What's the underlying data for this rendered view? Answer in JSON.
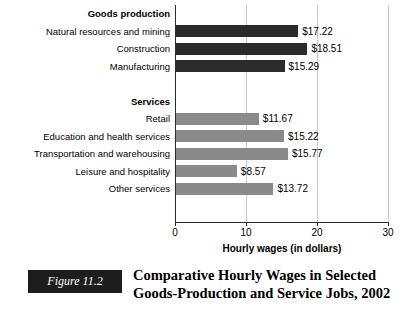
{
  "chart_data": {
    "type": "bar",
    "orientation": "horizontal",
    "title": "Comparative Hourly Wages in Selected Goods-Production and Service Jobs, 2002",
    "xlabel": "Hourly wages (in dollars)",
    "ylabel": "",
    "xlim": [
      0,
      30
    ],
    "xticks": [
      "0",
      "10",
      "20",
      "30"
    ],
    "grid": true,
    "legend": "none",
    "groups": [
      {
        "name": "Goods production",
        "color": "#2b2b2b",
        "categories": [
          "Natural resources and mining",
          "Construction",
          "Manufacturing"
        ],
        "values": [
          17.22,
          18.51,
          15.29
        ],
        "labels": [
          "$17.22",
          "$18.51",
          "$15.29"
        ]
      },
      {
        "name": "Services",
        "color": "#8a8a8a",
        "categories": [
          "Retail",
          "Education and health services",
          "Transportation and warehousing",
          "Leisure and hospitality",
          "Other services"
        ],
        "values": [
          11.67,
          15.22,
          15.77,
          8.57,
          13.72
        ],
        "labels": [
          "$11.67",
          "$15.22",
          "$15.77",
          "$8.57",
          "$13.72"
        ]
      }
    ]
  },
  "rows": [
    {
      "kind": "header",
      "label": "Goods production"
    },
    {
      "kind": "bar",
      "label": "Natural resources and mining",
      "value": 17.22,
      "value_label": "$17.22",
      "series": "goods"
    },
    {
      "kind": "bar",
      "label": "Construction",
      "value": 18.51,
      "value_label": "$18.51",
      "series": "goods"
    },
    {
      "kind": "bar",
      "label": "Manufacturing",
      "value": 15.29,
      "value_label": "$15.29",
      "series": "goods"
    },
    {
      "kind": "spacer",
      "label": ""
    },
    {
      "kind": "header",
      "label": "Services"
    },
    {
      "kind": "bar",
      "label": "Retail",
      "value": 11.67,
      "value_label": "$11.67",
      "series": "services"
    },
    {
      "kind": "bar",
      "label": "Education and health services",
      "value": 15.22,
      "value_label": "$15.22",
      "series": "services"
    },
    {
      "kind": "bar",
      "label": "Transportation and warehousing",
      "value": 15.77,
      "value_label": "$15.77",
      "series": "services"
    },
    {
      "kind": "bar",
      "label": "Leisure and hospitality",
      "value": 8.57,
      "value_label": "$8.57",
      "series": "services"
    },
    {
      "kind": "bar",
      "label": "Other services",
      "value": 13.72,
      "value_label": "$13.72",
      "series": "services"
    }
  ],
  "axis": {
    "title": "Hourly wages (in dollars)",
    "ticks": [
      "0",
      "10",
      "20",
      "30"
    ],
    "tick_values": [
      0,
      10,
      20,
      30
    ]
  },
  "caption": {
    "figure_number": "Figure 11.2",
    "line1": "Comparative Hourly Wages in Selected",
    "line2": "Goods-Production and Service Jobs, 2002"
  },
  "colors": {
    "goods_bar": "#2b2b2b",
    "services_bar": "#8a8a8a",
    "axis": "#2b2b2b",
    "gridline": "#c9c9c9",
    "figure_box": "#1d1d1d"
  }
}
